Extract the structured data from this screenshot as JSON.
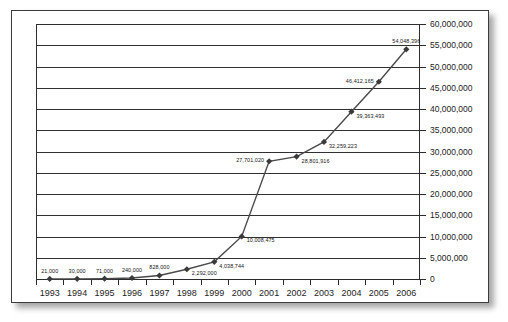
{
  "chart_data": {
    "type": "line",
    "title": "",
    "subtitle": "",
    "xlabel": "",
    "ylabel": "",
    "categories": [
      "1993",
      "1994",
      "1995",
      "1996",
      "1997",
      "1998",
      "1999",
      "2000",
      "2001",
      "2002",
      "2003",
      "2004",
      "2005",
      "2006"
    ],
    "values": [
      21000,
      30000,
      71000,
      240000,
      828000,
      2292000,
      4038744,
      10008475,
      27701020,
      28801916,
      32259223,
      39363493,
      46412165,
      54048396
    ],
    "point_labels": [
      "21,000",
      "30,000",
      "71,000",
      "240,000",
      "828,000",
      "2,292,000",
      "4,038,744",
      "10,008,475",
      "27,701,020",
      "28,801,916",
      "32,259,223",
      "39,363,493",
      "46,412,165",
      "54,048,396"
    ],
    "ylim": [
      0,
      60000000
    ],
    "ytick_step": 5000000,
    "ytick_labels": [
      "0",
      "5,000,000",
      "10,000,000",
      "15,000,000",
      "20,000,000",
      "25,000,000",
      "30,000,000",
      "35,000,000",
      "40,000,000",
      "45,000,000",
      "50,000,000",
      "55,000,000",
      "60,000,000"
    ],
    "ytick_values": [
      0,
      5000000,
      10000000,
      15000000,
      20000000,
      25000000,
      30000000,
      35000000,
      40000000,
      45000000,
      50000000,
      55000000,
      60000000
    ],
    "yaxis_position": "right",
    "xaxis_position": "bottom",
    "grid": "horizontal",
    "legend": "none",
    "series_name": "",
    "marker": "diamond",
    "line_color": "#4a4a4a",
    "marker_color": "#3a3a3a",
    "grid_color": "#303030",
    "text_color": "#1d1d1d",
    "background": "#ffffff"
  }
}
